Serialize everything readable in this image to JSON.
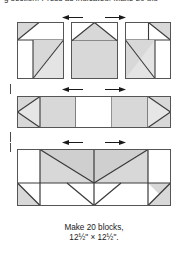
{
  "page": {
    "clipped_heading": "g section. Press as indicated. Make 20 blo",
    "background_color": "#ffffff"
  },
  "colors": {
    "shade_fill": "#d8d8d8",
    "background_fill": "#ffffff",
    "outline": "#555555",
    "seam_line": "#3a3a3a",
    "arrow": "#1a1a1a",
    "text": "#1a1a1a"
  },
  "figure": {
    "rows": [
      {
        "name": "top-unit-row",
        "description": "Three pieced square units shown side by side",
        "units": [
          {
            "name": "corner-hst-unit-left",
            "patches": [
              "top-left half-square triangle shaded",
              "top-right rectangle background",
              "bottom-left small square background",
              "bottom-right large half-square triangle shaded"
            ]
          },
          {
            "name": "flying-geese-top-unit-center",
            "patches": [
              "top center flying geese triangle shaded",
              "top corners background",
              "bottom large square shaded"
            ]
          },
          {
            "name": "corner-hst-unit-right",
            "patches": [
              "top-left rectangle background",
              "top-right half-square triangle shaded",
              "bottom-left large half-square triangle shaded",
              "bottom-right square background"
            ]
          }
        ],
        "pressing_arrows": [
          {
            "name": "press-arrow-left",
            "direction": "left"
          },
          {
            "name": "press-arrow-right",
            "direction": "right"
          }
        ]
      },
      {
        "name": "middle-strip-row",
        "description": "Horizontal sashing strip with side-pointing triangles at both ends and a plain center square",
        "units": [
          {
            "name": "left-point-triangle-unit",
            "patches": [
              "left pointing background triangle",
              "shaded corners"
            ]
          },
          {
            "name": "shaded-rectangle-left",
            "patches": [
              "shaded rectangle"
            ]
          },
          {
            "name": "center-background-square",
            "patches": [
              "plain background square"
            ]
          },
          {
            "name": "shaded-rectangle-right",
            "patches": [
              "shaded rectangle"
            ]
          },
          {
            "name": "right-point-triangle-unit",
            "patches": [
              "right pointing background triangle",
              "shaded corners"
            ]
          }
        ],
        "pressing_arrows": [
          {
            "name": "press-arrow-left",
            "direction": "left"
          },
          {
            "name": "press-arrow-right",
            "direction": "right"
          }
        ]
      },
      {
        "name": "bottom-unit-row",
        "description": "Wide block section, four columns by two rows of half-square triangles forming a zigzag chevron",
        "units": [
          {
            "name": "hst-col-1",
            "patches": [
              "top background square",
              "bottom-left shaded triangle"
            ]
          },
          {
            "name": "hst-col-2",
            "patches": [
              "top shaded triangle descending",
              "bottom shaded triangle"
            ]
          },
          {
            "name": "hst-col-3",
            "patches": [
              "top shaded square",
              "bottom V background"
            ]
          },
          {
            "name": "hst-col-4",
            "patches": [
              "top shaded triangle ascending",
              "bottom-right shaded triangle"
            ]
          }
        ],
        "pressing_arrows": [
          {
            "name": "press-arrow-left",
            "direction": "left"
          },
          {
            "name": "press-arrow-right",
            "direction": "right"
          }
        ]
      }
    ],
    "margin_ticks": [
      {
        "name": "alignment-tick-upper"
      },
      {
        "name": "alignment-tick-middle"
      },
      {
        "name": "alignment-tick-lower"
      }
    ]
  },
  "caption": {
    "line1": "Make 20 blocks,",
    "line2": "12½\" × 12½\"."
  }
}
